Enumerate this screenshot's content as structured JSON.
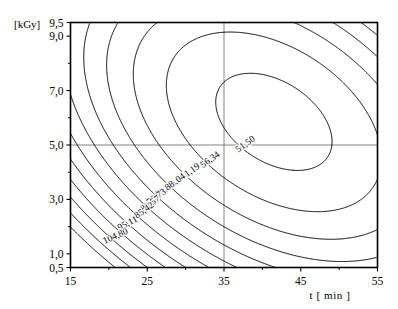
{
  "axes": {
    "y_unit_label": "[kGy]",
    "x_title": "t [ min ]",
    "y_ticks": [
      {
        "value": 9.5,
        "label": "9,5"
      },
      {
        "value": 9.0,
        "label": "9,0"
      },
      {
        "value": 7.0,
        "label": "7,0"
      },
      {
        "value": 5.0,
        "label": "5,0"
      },
      {
        "value": 3.0,
        "label": "3,0"
      },
      {
        "value": 1.0,
        "label": "1,0"
      },
      {
        "value": 0.5,
        "label": "0,5"
      }
    ],
    "x_ticks": [
      {
        "value": 15,
        "label": "15"
      },
      {
        "value": 25,
        "label": "25"
      },
      {
        "value": 35,
        "label": "35"
      },
      {
        "value": 45,
        "label": "45"
      },
      {
        "value": 55,
        "label": "55"
      }
    ],
    "x_minor_ticks": [
      20,
      30,
      40,
      50
    ],
    "xlim": [
      15,
      55
    ],
    "ylim": [
      0.5,
      9.5
    ],
    "gridlines": {
      "x": [
        35
      ],
      "y": [
        5.0
      ]
    },
    "frame_color": "#000000",
    "grid_color": "#666666",
    "contour_color": "#000000"
  },
  "chart_data": {
    "type": "contour",
    "title": "",
    "xlabel": "t [ min ]",
    "ylabel": "[kGy]",
    "xlim": [
      15,
      55
    ],
    "ylim": [
      0.5,
      9.5
    ],
    "grid": true,
    "legend": "none",
    "center": {
      "x": 41.5,
      "y": 5.85,
      "value": 49.5
    },
    "levels": [
      51.5,
      56.34,
      61.19,
      66.04,
      70.88,
      75.73,
      80.57,
      85.42,
      90.26,
      95.11,
      100.0,
      104.8
    ],
    "level_labels": [
      "51,50",
      "56,34",
      "61,19",
      "66,04",
      "70,88",
      "75,73",
      "80,57",
      "85,42",
      "90,26",
      "95,11",
      "100,00",
      "104,80"
    ],
    "labeled_levels": [
      {
        "level": 51.5,
        "label": "51,50",
        "x": 38.0,
        "y": 4.95,
        "rotation": -36
      },
      {
        "level": 56.34,
        "label": "56,34",
        "x": 33.4,
        "y": 4.38,
        "rotation": -36
      },
      {
        "level": 61.19,
        "label": "61,19",
        "x": 30.8,
        "y": 3.94,
        "rotation": -36
      },
      {
        "level": 66.04,
        "label": "66,04",
        "x": 28.9,
        "y": 3.58,
        "rotation": -36
      },
      {
        "level": 70.88,
        "label": "70,88",
        "x": 27.5,
        "y": 3.29,
        "rotation": -36
      },
      {
        "level": 75.73,
        "label": "75,73",
        "x": 26.4,
        "y": 3.01,
        "rotation": -36
      },
      {
        "level": 80.57,
        "label": "80,57",
        "x": 25.6,
        "y": 2.76,
        "rotation": -36
      },
      {
        "level": 85.42,
        "label": "85,42",
        "x": 24.8,
        "y": 2.52,
        "rotation": -36
      },
      {
        "level": 95.11,
        "label": "95,11",
        "x": 22.6,
        "y": 2.03,
        "rotation": -28
      },
      {
        "level": 104.8,
        "label": "104,80",
        "x": 21.0,
        "y": 1.56,
        "rotation": -24
      }
    ]
  }
}
